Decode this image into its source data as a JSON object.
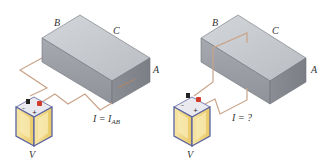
{
  "panels": [
    {
      "id": "left",
      "labels": {
        "corner_b": "B",
        "corner_c": "C",
        "corner_a": "A",
        "battery": "V"
      },
      "current": {
        "prefix": "I = I",
        "subscript": "AB"
      }
    },
    {
      "id": "right",
      "labels": {
        "corner_b": "B",
        "corner_c": "C",
        "corner_a": "A",
        "battery": "V"
      },
      "current": {
        "prefix": "I = ?",
        "subscript": ""
      }
    }
  ],
  "colors": {
    "wire": "#c9a48a",
    "block_top": "#c4c7cc",
    "block_front": "#9ea2a8",
    "block_side": "#8c9096",
    "battery_body": "#f2d98a",
    "battery_frame": "#5a63a0",
    "terminal_pos": "#d23a2a",
    "terminal_neg": "#222222"
  }
}
